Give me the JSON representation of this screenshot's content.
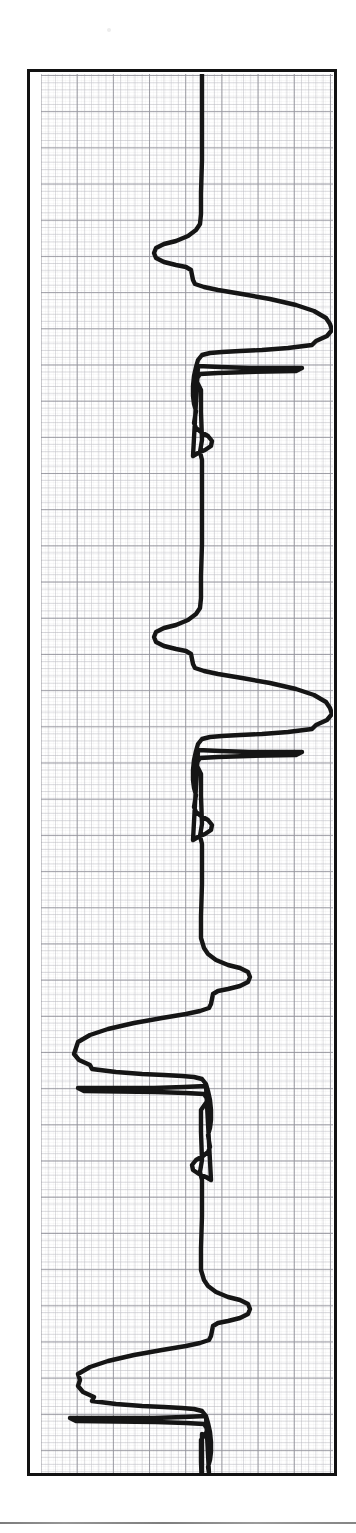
{
  "figure": {
    "kind": "ecg-rhythm-strip",
    "orientation": "rotated-90-deg",
    "caption": "",
    "frame": {
      "border_color": "#121212",
      "paper_color": "#ffffff"
    }
  },
  "grid": {
    "minor_color": "#c4c4ca",
    "major_color": "#96969e",
    "minor_spacing_px": 7.24,
    "major_spacing_px": 36.2,
    "major_every": 5
  },
  "trace": {
    "color": "#151515",
    "width_px": 4.4,
    "baseline_x_px": 161
  },
  "footer": {
    "rule_color": "#7d7d7d"
  },
  "chart_data": {
    "type": "line",
    "title": "",
    "subtitle": "",
    "xlabel": "",
    "ylabel": "",
    "legend": [],
    "annotations": [],
    "grid": true,
    "orientation": "vertical-time-axis",
    "axis_note": "Time runs top-to-bottom (y); signal amplitude deflects along x. Baseline at x = 161 px of the 292 px plot.",
    "xlim": [
      0,
      292
    ],
    "ylim": [
      0,
      1399
    ],
    "beats": 4,
    "series": [
      {
        "name": "ECG lead trace",
        "points": [
          [
            161,
            0
          ],
          [
            161,
            26
          ],
          [
            161,
            60
          ],
          [
            161,
            96
          ],
          [
            160,
            122
          ],
          [
            160,
            150
          ],
          [
            160,
            176
          ],
          [
            159,
            196
          ],
          [
            158,
            206
          ],
          [
            158,
            216
          ],
          [
            157,
            224
          ],
          [
            157,
            236
          ],
          [
            157,
            252
          ],
          [
            157,
            266
          ],
          [
            157,
            280
          ],
          [
            157,
            296
          ],
          [
            157,
            312
          ],
          [
            156,
            326
          ],
          [
            156,
            340
          ],
          [
            156,
            352
          ],
          [
            155,
            362
          ],
          [
            154,
            368
          ],
          [
            152,
            372
          ],
          [
            148,
            374
          ],
          [
            142,
            374
          ],
          [
            134,
            371
          ],
          [
            126,
            365
          ],
          [
            120,
            359
          ],
          [
            116,
            352
          ],
          [
            114,
            346
          ],
          [
            113,
            341
          ],
          [
            113,
            335
          ],
          [
            115,
            330
          ],
          [
            119,
            326
          ],
          [
            124,
            322
          ],
          [
            131,
            318
          ],
          [
            138,
            315
          ],
          [
            144,
            313
          ],
          [
            148,
            311
          ],
          [
            150,
            309
          ],
          [
            151,
            306
          ],
          [
            152,
            302
          ],
          [
            153,
            298
          ],
          [
            155,
            294
          ],
          [
            160,
            291
          ],
          [
            170,
            288
          ],
          [
            186,
            285
          ],
          [
            206,
            281
          ],
          [
            228,
            276
          ],
          [
            248,
            270
          ],
          [
            264,
            263
          ],
          [
            276,
            256
          ],
          [
            284,
            249
          ],
          [
            288,
            242
          ],
          [
            289,
            236
          ],
          [
            287,
            230
          ],
          [
            282,
            225
          ],
          [
            273,
            221
          ],
          [
            260,
            218
          ],
          [
            244,
            216
          ],
          [
            226,
            215
          ],
          [
            208,
            214
          ],
          [
            192,
            213
          ],
          [
            180,
            212
          ],
          [
            172,
            211
          ],
          [
            167,
            209
          ],
          [
            164,
            205
          ],
          [
            162,
            200
          ],
          [
            160,
            194
          ],
          [
            159,
            186
          ],
          [
            158,
            178
          ],
          [
            158,
            170
          ],
          [
            158,
            162
          ],
          [
            158,
            154
          ],
          [
            159,
            146
          ],
          [
            160,
            140
          ],
          [
            161,
            136
          ],
          [
            160,
            132
          ],
          [
            159,
            128
          ],
          [
            159,
            124
          ],
          [
            160,
            120
          ],
          [
            161,
            116
          ],
          [
            161,
            110
          ],
          [
            160,
            104
          ],
          [
            159,
            98
          ],
          [
            158,
            92
          ],
          [
            158,
            86
          ],
          [
            159,
            80
          ],
          [
            161,
            74
          ],
          [
            164,
            70
          ],
          [
            168,
            67
          ],
          [
            172,
            66
          ],
          [
            176,
            67
          ],
          [
            179,
            70
          ],
          [
            180,
            74
          ],
          [
            179,
            78
          ],
          [
            176,
            81
          ],
          [
            172,
            82
          ],
          [
            168,
            82
          ],
          [
            164,
            81
          ],
          [
            161,
            78
          ],
          [
            160,
            74
          ],
          [
            160,
            68
          ],
          [
            160,
            60
          ],
          [
            160,
            50
          ],
          [
            160,
            40
          ],
          [
            160,
            28
          ],
          [
            160,
            16
          ],
          [
            160,
            4
          ],
          [
            160,
            0
          ]
        ],
        "points_note": "Dense sampled polyline is supplied in the path_d field below; the array above is a coarse landmark subset."
      }
    ],
    "beat_landmarks": [
      {
        "beat": 1,
        "p_wave_y": 232,
        "q_y": 292,
        "r_peak_x": 289,
        "r_peak_y": 236,
        "s_trough_x": 113,
        "s_trough_y": 338,
        "t_wave_y": 374
      },
      {
        "beat": 2,
        "p_wave_y": 614,
        "q_y": 676,
        "r_peak_x": 289,
        "r_peak_y": 620,
        "s_trough_x": 113,
        "s_trough_y": 722,
        "t_wave_y": 760
      },
      {
        "beat": 3,
        "p_wave_y": 940,
        "q_y": 978,
        "r_peak_x": 286,
        "r_peak_y": 960,
        "s_trough_x": 38,
        "s_trough_y": 944,
        "t_wave_y": 902
      },
      {
        "beat": 4,
        "p_wave_y": 1218,
        "q_y": 1268,
        "r_peak_x": 281,
        "r_peak_y": 1290,
        "s_trough_x": 30,
        "s_trough_y": 1248,
        "t_wave_y": 1180
      }
    ],
    "path_d": "M161,0 L161,96 L160,150 L159,196 L158,212 L157,228 L157,272 L157,300 L156,334 L155,358 L153,368 L149,373 L142,374 L133,370 L124,363 L117,354 L113,345 L113,336 L116,329 L122,324 L131,319 L140,315 L147,312 L151,308 L152,302 L154,296 L159,292 L169,288 L186,285 L208,281 L230,275 L250,269 L266,262 L278,254 L285,246 L288,238 L286,231 L279,225 L266,220 L248,217 L228,215 L208,214 L190,213 L176,212 L168,210 L164,205 L162,198 L160,188 L158,176 L158,162 L159,150 L160,140 L159,132 L159,124 L161,116 L161,107 L159,98 L158,88 L159,80 L162,73 L167,68 L172,66 L177,68 L180,73 L179,79 L175,82 L169,82 L164,80 L161,76 L160,68 L160,54 L160,36 L160,18 L160,0",
    "path_note": "path_d is expressed in plot coordinates with y measured downward from the top of the plot; the renderer streams the full beat cycle four times with the per-beat landmark offsets."
  }
}
